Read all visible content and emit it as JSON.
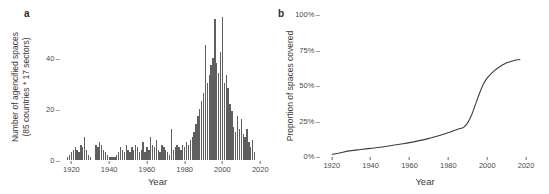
{
  "figure": {
    "background": "#ffffff",
    "bar_color": "#5f5f5f",
    "line_color": "#3d3d3d"
  },
  "panel_a": {
    "letter": "a",
    "ylabel": "Number of agencified spaces\n(85 countries * 17 sectors)",
    "ylabel_line1": "Number of agencified spaces",
    "ylabel_line2": "(85 countries * 17 sectors)",
    "xlabel": "Year"
  },
  "panel_b": {
    "letter": "b",
    "ylabel": "Proportion of spaces covered",
    "xlabel": "Year"
  },
  "chart_data": [
    {
      "type": "bar",
      "panel": "a",
      "title": "",
      "xlabel": "Year",
      "ylabel": "Number of agencified spaces (85 countries * 17 sectors)",
      "xlim": [
        1915,
        2022
      ],
      "ylim": [
        0,
        57
      ],
      "xticks": [
        1920,
        1940,
        1960,
        1980,
        2000,
        2020
      ],
      "yticks": [
        0,
        20,
        40
      ],
      "ytick_labels": [
        "0",
        "20",
        "40"
      ],
      "xtick_labels": [
        "1920",
        "1940",
        "1960",
        "1980",
        "2000",
        "2020"
      ],
      "grid": false,
      "legend": null,
      "categories": [
        1918,
        1919,
        1920,
        1921,
        1922,
        1923,
        1924,
        1925,
        1926,
        1927,
        1928,
        1929,
        1930,
        1931,
        1932,
        1933,
        1934,
        1935,
        1936,
        1937,
        1938,
        1939,
        1940,
        1941,
        1942,
        1943,
        1944,
        1945,
        1946,
        1947,
        1948,
        1949,
        1950,
        1951,
        1952,
        1953,
        1954,
        1955,
        1956,
        1957,
        1958,
        1959,
        1960,
        1961,
        1962,
        1963,
        1964,
        1965,
        1966,
        1967,
        1968,
        1969,
        1970,
        1971,
        1972,
        1973,
        1974,
        1975,
        1976,
        1977,
        1978,
        1979,
        1980,
        1981,
        1982,
        1983,
        1984,
        1985,
        1986,
        1987,
        1988,
        1989,
        1990,
        1991,
        1992,
        1993,
        1994,
        1995,
        1996,
        1997,
        1998,
        1999,
        2000,
        2001,
        2002,
        2003,
        2004,
        2005,
        2006,
        2007,
        2008,
        2009,
        2010,
        2011,
        2012,
        2013,
        2014,
        2015,
        2016,
        2017
      ],
      "values": [
        1,
        2,
        3,
        4,
        5,
        4,
        3,
        6,
        5,
        9,
        4,
        2,
        1,
        0,
        0,
        6,
        5,
        7,
        6,
        4,
        3,
        2,
        1,
        1,
        1,
        1,
        2,
        3,
        5,
        4,
        3,
        6,
        4,
        3,
        5,
        4,
        6,
        5,
        3,
        4,
        7,
        3,
        5,
        4,
        9,
        6,
        5,
        8,
        4,
        3,
        6,
        5,
        4,
        3,
        2,
        12,
        4,
        5,
        6,
        5,
        4,
        6,
        5,
        7,
        6,
        8,
        9,
        11,
        14,
        17,
        20,
        23,
        26,
        45,
        30,
        33,
        37,
        40,
        55,
        38,
        34,
        42,
        56,
        30,
        33,
        28,
        22,
        19,
        13,
        11,
        17,
        12,
        16,
        10,
        9,
        12,
        7,
        5,
        8,
        3
      ]
    },
    {
      "type": "line",
      "panel": "b",
      "title": "",
      "xlabel": "Year",
      "ylabel": "Proportion of spaces covered",
      "xlim": [
        1915,
        2022
      ],
      "ylim": [
        0,
        100
      ],
      "xticks": [
        1920,
        1940,
        1960,
        1980,
        2000,
        2020
      ],
      "yticks": [
        0,
        25,
        50,
        75,
        100
      ],
      "ytick_labels": [
        "0%",
        "25%",
        "50%",
        "75%",
        "100%"
      ],
      "xtick_labels": [
        "1920",
        "1940",
        "1960",
        "1980",
        "2000",
        "2020"
      ],
      "grid": false,
      "legend": null,
      "unit": "%",
      "x": [
        1920,
        1925,
        1930,
        1935,
        1940,
        1945,
        1950,
        1955,
        1960,
        1965,
        1970,
        1975,
        1980,
        1983,
        1986,
        1988,
        1990,
        1992,
        1994,
        1996,
        1998,
        2000,
        2002,
        2004,
        2006,
        2008,
        2010,
        2012,
        2014,
        2016,
        2017
      ],
      "values": [
        1.0,
        2.5,
        3.8,
        4.6,
        5.4,
        6.2,
        7.2,
        8.3,
        9.4,
        10.8,
        12.4,
        14.2,
        16.5,
        18.0,
        19.3,
        20.3,
        23.5,
        29.0,
        36.5,
        44.0,
        50.5,
        55.0,
        58.0,
        60.5,
        62.5,
        64.2,
        65.6,
        66.6,
        67.3,
        67.8,
        68.0
      ]
    }
  ]
}
